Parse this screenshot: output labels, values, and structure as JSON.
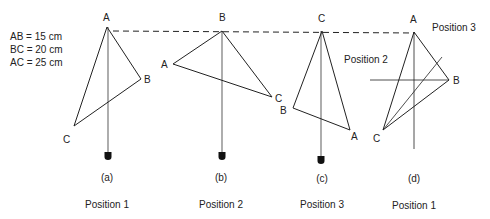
{
  "measurements": [
    "AB = 15 cm",
    "BC = 20 cm",
    "AC = 25 cm"
  ],
  "panels": [
    {
      "id": "a",
      "caption": "(a)",
      "position_label": "Position 1",
      "vertices": {
        "A": [
          107,
          27
        ],
        "B": [
          141,
          79
        ],
        "C": [
          74,
          126
        ]
      },
      "suspension_vertex": "A",
      "labels": {
        "A": "A",
        "B": "B",
        "C": "C"
      }
    },
    {
      "id": "b",
      "caption": "(b)",
      "position_label": "Position 2",
      "vertices": {
        "B": [
          222,
          31
        ],
        "A": [
          173,
          64
        ],
        "C": [
          272,
          97
        ]
      },
      "suspension_vertex": "B",
      "labels": {
        "A": "A",
        "B": "B",
        "C": "C"
      }
    },
    {
      "id": "c",
      "caption": "(c)",
      "position_label": "Position 3",
      "vertices": {
        "C": [
          322,
          31
        ],
        "B": [
          293,
          108
        ],
        "A": [
          350,
          130
        ]
      },
      "suspension_vertex": "C",
      "labels": {
        "A": "A",
        "B": "B",
        "C": "C"
      }
    },
    {
      "id": "d",
      "caption": "(d)",
      "position_label": "Position 1",
      "vertices": {
        "A": [
          414,
          32
        ],
        "B": [
          449,
          80
        ],
        "C": [
          383,
          130
        ]
      },
      "labels": {
        "A": "A",
        "B": "B",
        "C": "C"
      },
      "line_labels": {
        "position2": "Position 2",
        "position3": "Position 3"
      }
    }
  ],
  "colors": {
    "line": "#222222",
    "plumb": "#777777",
    "weight": "#111111"
  }
}
